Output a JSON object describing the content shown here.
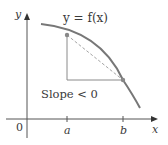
{
  "diagram": {
    "curve_label": "y = f(x)",
    "slope_label": "Slope < 0",
    "axes": {
      "x_label": "x",
      "y_label": "y",
      "origin_label": "0"
    },
    "ticks": [
      {
        "label": "a"
      },
      {
        "label": "b"
      }
    ],
    "colors": {
      "curve": "#7a7a7a",
      "axis": "#555555",
      "secant": "#9a9a9a",
      "point": "#8a8a8a",
      "text": "#3a3a3a"
    }
  }
}
